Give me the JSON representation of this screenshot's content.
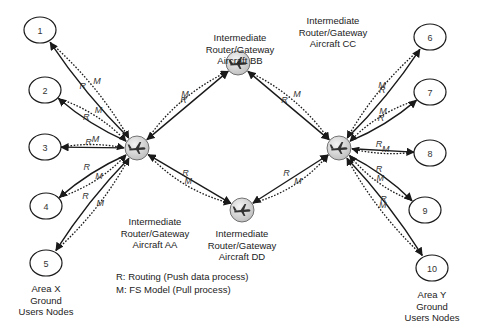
{
  "diagram": {
    "type": "network-topology",
    "ground_nodes_left": {
      "area_label": [
        "Area X",
        "Ground",
        "Users Nodes"
      ],
      "nodes": [
        {
          "id": "1",
          "label": "1",
          "x": 40,
          "y": 30
        },
        {
          "id": "2",
          "label": "2",
          "x": 45,
          "y": 90
        },
        {
          "id": "3",
          "label": "3",
          "x": 45,
          "y": 147
        },
        {
          "id": "4",
          "label": "4",
          "x": 46,
          "y": 206
        },
        {
          "id": "5",
          "label": "5",
          "x": 46,
          "y": 263
        }
      ]
    },
    "ground_nodes_right": {
      "area_label": [
        "Area Y",
        "Ground",
        "Users Nodes"
      ],
      "nodes": [
        {
          "id": "6",
          "label": "6",
          "x": 430,
          "y": 37
        },
        {
          "id": "7",
          "label": "7",
          "x": 430,
          "y": 92
        },
        {
          "id": "8",
          "label": "8",
          "x": 430,
          "y": 153
        },
        {
          "id": "9",
          "label": "9",
          "x": 425,
          "y": 210
        },
        {
          "id": "10",
          "label": "10",
          "x": 432,
          "y": 268
        }
      ]
    },
    "aircraft": [
      {
        "id": "AA",
        "x": 137,
        "y": 148,
        "label": [
          "Intermediate",
          "Router/Gateway",
          "Aircraft AA"
        ]
      },
      {
        "id": "BB",
        "x": 238,
        "y": 63,
        "label": [
          "Intermediate",
          "Router/Gateway",
          "Aircraft BB"
        ]
      },
      {
        "id": "CC",
        "x": 339,
        "y": 148,
        "label": [
          "Intermediate",
          "Router/Gateway",
          "Aircraft CC"
        ]
      },
      {
        "id": "DD",
        "x": 242,
        "y": 210,
        "label": [
          "Intermediate",
          "Router/Gateway",
          "Aircraft DD"
        ]
      }
    ],
    "edge_labels": {
      "routing": "R",
      "model": "M"
    },
    "edges": [
      {
        "from": "AA",
        "to": "1",
        "type": "R"
      },
      {
        "from": "AA",
        "to": "2",
        "type": "R"
      },
      {
        "from": "AA",
        "to": "3",
        "type": "R"
      },
      {
        "from": "AA",
        "to": "4",
        "type": "R"
      },
      {
        "from": "AA",
        "to": "5",
        "type": "R"
      },
      {
        "from": "1",
        "to": "AA",
        "type": "M"
      },
      {
        "from": "2",
        "to": "AA",
        "type": "M"
      },
      {
        "from": "3",
        "to": "AA",
        "type": "M"
      },
      {
        "from": "4",
        "to": "AA",
        "type": "M"
      },
      {
        "from": "5",
        "to": "AA",
        "type": "M"
      },
      {
        "from": "AA",
        "to": "BB",
        "type": "R"
      },
      {
        "from": "AA",
        "to": "DD",
        "type": "R"
      },
      {
        "from": "BB",
        "to": "CC",
        "type": "R"
      },
      {
        "from": "DD",
        "to": "CC",
        "type": "R"
      },
      {
        "from": "AA",
        "to": "BB",
        "type": "M"
      },
      {
        "from": "AA",
        "to": "DD",
        "type": "M"
      },
      {
        "from": "BB",
        "to": "CC",
        "type": "M"
      },
      {
        "from": "DD",
        "to": "CC",
        "type": "M"
      },
      {
        "from": "CC",
        "to": "6",
        "type": "R"
      },
      {
        "from": "CC",
        "to": "7",
        "type": "R"
      },
      {
        "from": "CC",
        "to": "8",
        "type": "R"
      },
      {
        "from": "CC",
        "to": "9",
        "type": "R"
      },
      {
        "from": "CC",
        "to": "10",
        "type": "R"
      },
      {
        "from": "6",
        "to": "CC",
        "type": "M"
      },
      {
        "from": "7",
        "to": "CC",
        "type": "M"
      },
      {
        "from": "8",
        "to": "CC",
        "type": "M"
      },
      {
        "from": "9",
        "to": "CC",
        "type": "M"
      },
      {
        "from": "10",
        "to": "CC",
        "type": "M"
      }
    ],
    "legend": {
      "r_line": "R:  Routing (Push data process)",
      "m_line": "M:  FS Model (Pull process)"
    },
    "colors": {
      "line": "#1a1a1a",
      "node_fill": "#ffffff",
      "aircraft_fill": "#d9d9d9",
      "text": "#222222"
    }
  }
}
